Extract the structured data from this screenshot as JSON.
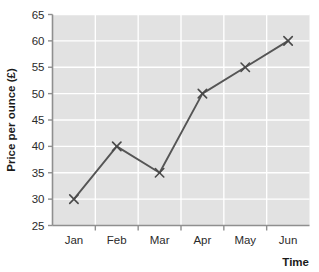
{
  "chart_data": {
    "type": "line",
    "title": "",
    "xlabel": "Time",
    "ylabel": "Price per ounce (£)",
    "categories": [
      "Jan",
      "Feb",
      "Mar",
      "Apr",
      "May",
      "Jun"
    ],
    "values": [
      30,
      40,
      35,
      50,
      55,
      60
    ],
    "series": [
      {
        "name": "Price per ounce",
        "values": [
          30,
          40,
          35,
          50,
          55,
          60
        ]
      }
    ],
    "ylim": [
      25,
      65
    ],
    "y_ticks": [
      "25",
      "30",
      "35",
      "40",
      "45",
      "50",
      "55",
      "60",
      "65"
    ],
    "y_tick_values": [
      25,
      30,
      35,
      40,
      45,
      50,
      55,
      60,
      65
    ],
    "x_ticks": [
      "Jan",
      "Feb",
      "Mar",
      "Apr",
      "May",
      "Jun"
    ],
    "grid": true,
    "legend": false,
    "legend_position": "none",
    "marker": "x",
    "colors": {
      "line": "#555555",
      "marker": "#4a4a4a",
      "plot_background": "#e2e2e2",
      "gridline": "#ffffff",
      "axis": "#8f8f8f",
      "text": "#1a1a1a",
      "page_background": "#ffffff"
    }
  }
}
